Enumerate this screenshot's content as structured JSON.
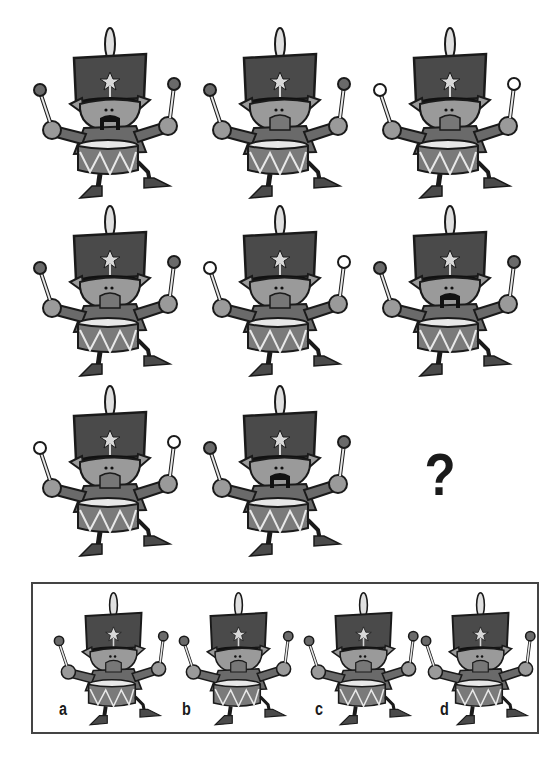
{
  "puzzle": {
    "question_mark": "?",
    "grid": [
      {
        "row": 1,
        "col": 1,
        "stick_tips": "dark",
        "mustache": true,
        "drum_pattern": "zigzag"
      },
      {
        "row": 1,
        "col": 2,
        "stick_tips": "dark",
        "mustache": false,
        "drum_pattern": "zigzag-dots"
      },
      {
        "row": 1,
        "col": 3,
        "stick_tips": "white",
        "mustache": false,
        "drum_pattern": "zigzag"
      },
      {
        "row": 2,
        "col": 1,
        "stick_tips": "dark",
        "mustache": false,
        "drum_pattern": "zigzag"
      },
      {
        "row": 2,
        "col": 2,
        "stick_tips": "white",
        "mustache": false,
        "drum_pattern": "zigzag"
      },
      {
        "row": 2,
        "col": 3,
        "stick_tips": "dark",
        "mustache": true,
        "drum_pattern": "zigzag-dots"
      },
      {
        "row": 3,
        "col": 1,
        "stick_tips": "white",
        "mustache": false,
        "drum_pattern": "zigzag-dots"
      },
      {
        "row": 3,
        "col": 2,
        "stick_tips": "dark",
        "mustache": true,
        "drum_pattern": "zigzag"
      }
    ],
    "options": [
      {
        "label": "a",
        "stick_tips": "dark",
        "mustache": false,
        "drum_pattern": "zigzag"
      },
      {
        "label": "b",
        "stick_tips": "dark",
        "mustache": false,
        "drum_pattern": "zigzag"
      },
      {
        "label": "c",
        "stick_tips": "dark",
        "mustache": false,
        "drum_pattern": "zigzag"
      },
      {
        "label": "d",
        "stick_tips": "dark",
        "mustache": false,
        "drum_pattern": "zigzag"
      }
    ]
  },
  "colors": {
    "hat": "#4a4a4a",
    "skin": "#9a9a9a",
    "coat": "#6a6a6a",
    "drum": "#7a7a7a",
    "outline": "#1a1a1a",
    "light": "#e8e8e8"
  }
}
